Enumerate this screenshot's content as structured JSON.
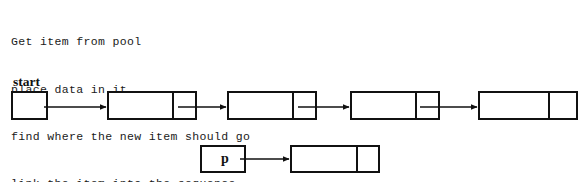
{
  "page": {
    "width": 584,
    "height": 182,
    "background": "#ffffff",
    "ink": "#111111"
  },
  "pseudocode": {
    "name": "linked-list-insert-pseudocode",
    "lines": [
      "Get item from pool",
      "place data in it",
      "find where the new item should go",
      "link the item into the sequence"
    ]
  },
  "diagram": {
    "type": "linked-list-diagram",
    "labels": [
      {
        "id": "start-label",
        "text": "start",
        "x": 13,
        "y": 74
      }
    ],
    "nodes": [
      {
        "id": "start-pointer-box",
        "kind": "pointer-box",
        "x": 11,
        "y": 91,
        "w": 37,
        "h": 29,
        "cells": [
          {
            "text": "",
            "split": null
          }
        ],
        "divider_x": null
      },
      {
        "id": "list-node-1",
        "kind": "list-node",
        "x": 107,
        "y": 91,
        "w": 90,
        "h": 29,
        "divider_x": 63,
        "cells": [
          {
            "text": ""
          },
          {
            "text": ""
          }
        ]
      },
      {
        "id": "list-node-2",
        "kind": "list-node",
        "x": 227,
        "y": 91,
        "w": 90,
        "h": 29,
        "divider_x": 63,
        "cells": [
          {
            "text": ""
          },
          {
            "text": ""
          }
        ]
      },
      {
        "id": "list-node-3",
        "kind": "list-node",
        "x": 350,
        "y": 91,
        "w": 90,
        "h": 29,
        "divider_x": 63,
        "cells": [
          {
            "text": ""
          },
          {
            "text": ""
          }
        ]
      },
      {
        "id": "list-node-4",
        "kind": "list-node",
        "x": 478,
        "y": 91,
        "w": 100,
        "h": 29,
        "divider_x": 68,
        "cells": [
          {
            "text": ""
          },
          {
            "text": ""
          }
        ]
      },
      {
        "id": "p-pointer-box",
        "kind": "pointer-box",
        "x": 200,
        "y": 145,
        "w": 46,
        "h": 28,
        "divider_x": null,
        "cells": [
          {
            "text": "p"
          }
        ]
      },
      {
        "id": "new-node",
        "kind": "list-node",
        "x": 290,
        "y": 145,
        "w": 90,
        "h": 28,
        "divider_x": 64,
        "cells": [
          {
            "text": ""
          },
          {
            "text": ""
          }
        ]
      }
    ],
    "arrows": [
      {
        "id": "arrow-start-to-node1",
        "x1": 44,
        "y1": 107,
        "x2": 106,
        "y2": 107
      },
      {
        "id": "arrow-node1-to-node2",
        "x1": 178,
        "y1": 107,
        "x2": 226,
        "y2": 107
      },
      {
        "id": "arrow-node2-to-node3",
        "x1": 298,
        "y1": 107,
        "x2": 349,
        "y2": 107
      },
      {
        "id": "arrow-node3-to-node4",
        "x1": 420,
        "y1": 107,
        "x2": 477,
        "y2": 107
      },
      {
        "id": "arrow-p-to-new-node",
        "x1": 240,
        "y1": 159,
        "x2": 289,
        "y2": 159
      }
    ]
  }
}
